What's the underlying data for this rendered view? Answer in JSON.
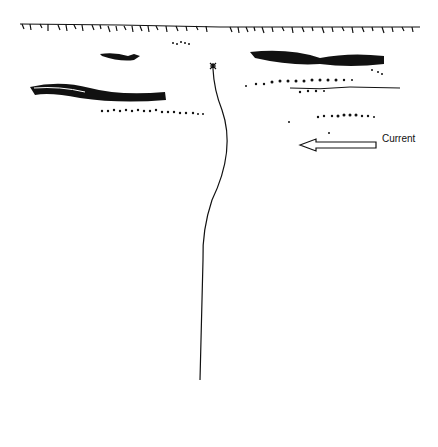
{
  "diagram": {
    "title": "",
    "labels": {
      "current": "Current"
    },
    "elements": {
      "far_bank": "grass-lined far bank",
      "near_bank": "grass-lined near bank",
      "fish": "trout",
      "fly": "fly",
      "rod": "fly rod with reel",
      "rotation_arrow": "curved arrow around rod indicating rotation",
      "current_arrow": "arrow pointing left",
      "weed_beds": "weed beds and gravel"
    },
    "colors": {
      "ink": "#111111",
      "background": "#ffffff"
    }
  }
}
